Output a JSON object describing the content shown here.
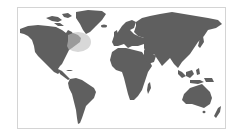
{
  "map": {
    "type": "world-map",
    "colors": {
      "background": "#ffffff",
      "frame_border": "#d4d4d4",
      "land": "#5f5f5f",
      "highlight": "#9a9a9a",
      "highlight_halo": "#d8d8d8"
    },
    "highlighted_region": "northeastern-north-america",
    "regions": [
      {
        "name": "north-america"
      },
      {
        "name": "greenland"
      },
      {
        "name": "canadian-arctic-islands"
      },
      {
        "name": "south-america"
      },
      {
        "name": "europe"
      },
      {
        "name": "africa"
      },
      {
        "name": "asia"
      },
      {
        "name": "southeast-asia-islands"
      },
      {
        "name": "australia"
      },
      {
        "name": "new-zealand"
      }
    ]
  }
}
